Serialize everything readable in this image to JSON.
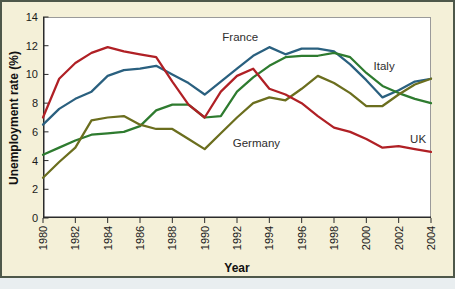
{
  "chart": {
    "y_axis_title": "Unemployment rate (%)",
    "x_axis_title": "Year"
  },
  "chart_data": {
    "type": "line",
    "title": "",
    "xlabel": "Year",
    "ylabel": "Unemployment rate (%)",
    "xlim": [
      1980,
      2004
    ],
    "ylim": [
      0,
      14
    ],
    "x_ticks": [
      1980,
      1982,
      1984,
      1986,
      1988,
      1990,
      1992,
      1994,
      1996,
      1998,
      2000,
      2002,
      2004
    ],
    "y_ticks": [
      0,
      2,
      4,
      6,
      8,
      10,
      12,
      14
    ],
    "grid": false,
    "legend_position": "inline-labels",
    "x": [
      1980,
      1981,
      1982,
      1983,
      1984,
      1985,
      1986,
      1987,
      1988,
      1989,
      1990,
      1991,
      1992,
      1993,
      1994,
      1995,
      1996,
      1997,
      1998,
      1999,
      2000,
      2001,
      2002,
      2003,
      2004
    ],
    "series": [
      {
        "name": "France",
        "color": "#2a607f",
        "label_x": 1992.2,
        "label_y": 12.6,
        "values": [
          6.5,
          7.6,
          8.3,
          8.8,
          9.9,
          10.3,
          10.4,
          10.6,
          10.0,
          9.4,
          8.6,
          9.5,
          10.4,
          11.3,
          11.9,
          11.4,
          11.8,
          11.8,
          11.6,
          10.7,
          9.6,
          8.4,
          8.9,
          9.5,
          9.7
        ]
      },
      {
        "name": "Italy",
        "color": "#2e7b2f",
        "label_x": 2001.1,
        "label_y": 10.6,
        "values": [
          4.4,
          4.9,
          5.4,
          5.8,
          5.9,
          6.0,
          6.4,
          7.5,
          7.9,
          7.9,
          7.0,
          7.1,
          8.8,
          9.8,
          10.6,
          11.2,
          11.3,
          11.3,
          11.5,
          11.2,
          10.1,
          9.2,
          8.7,
          8.3,
          8.0
        ]
      },
      {
        "name": "Germany",
        "color": "#6b6e1e",
        "label_x": 1993.2,
        "label_y": 5.2,
        "values": [
          2.8,
          3.9,
          4.9,
          6.8,
          7.0,
          7.1,
          6.5,
          6.2,
          6.2,
          5.5,
          4.8,
          5.9,
          7.0,
          8.0,
          8.4,
          8.2,
          9.0,
          9.9,
          9.4,
          8.7,
          7.8,
          7.8,
          8.6,
          9.3,
          9.7
        ]
      },
      {
        "name": "UK",
        "color": "#b02025",
        "label_x": 2003.2,
        "label_y": 5.5,
        "values": [
          7.0,
          9.7,
          10.8,
          11.5,
          11.9,
          11.6,
          11.4,
          11.2,
          9.5,
          7.9,
          7.0,
          8.8,
          9.9,
          10.4,
          9.0,
          8.6,
          8.0,
          7.1,
          6.3,
          6.0,
          5.5,
          4.9,
          5.0,
          4.8,
          4.6
        ]
      }
    ]
  }
}
